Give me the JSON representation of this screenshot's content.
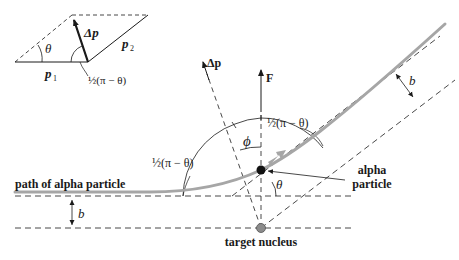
{
  "diagram": {
    "inset": {
      "theta_label": "θ",
      "delta_p_label": "Δp",
      "p1_label": "p",
      "p1_sub": "1",
      "p2_label": "p",
      "p2_sub": "2",
      "half_angle_label": "½(π − θ)"
    },
    "main": {
      "path_label": "path of alpha particle",
      "delta_p_label": "Δp",
      "force_label": "F",
      "phi_label": "ϕ",
      "half_angle_left_label": "½(π − θ)",
      "half_angle_right_label": "½(π − θ)",
      "theta_label": "θ",
      "b_left_label": "b",
      "b_right_label": "b",
      "alpha_label_line1": "alpha",
      "alpha_label_line2": "particle",
      "nucleus_label": "target nucleus"
    },
    "colors": {
      "path": "#a6a6a6",
      "ink": "#1a1a1a",
      "nucleus": "#8c8c8c",
      "alpha": "#111111"
    }
  }
}
